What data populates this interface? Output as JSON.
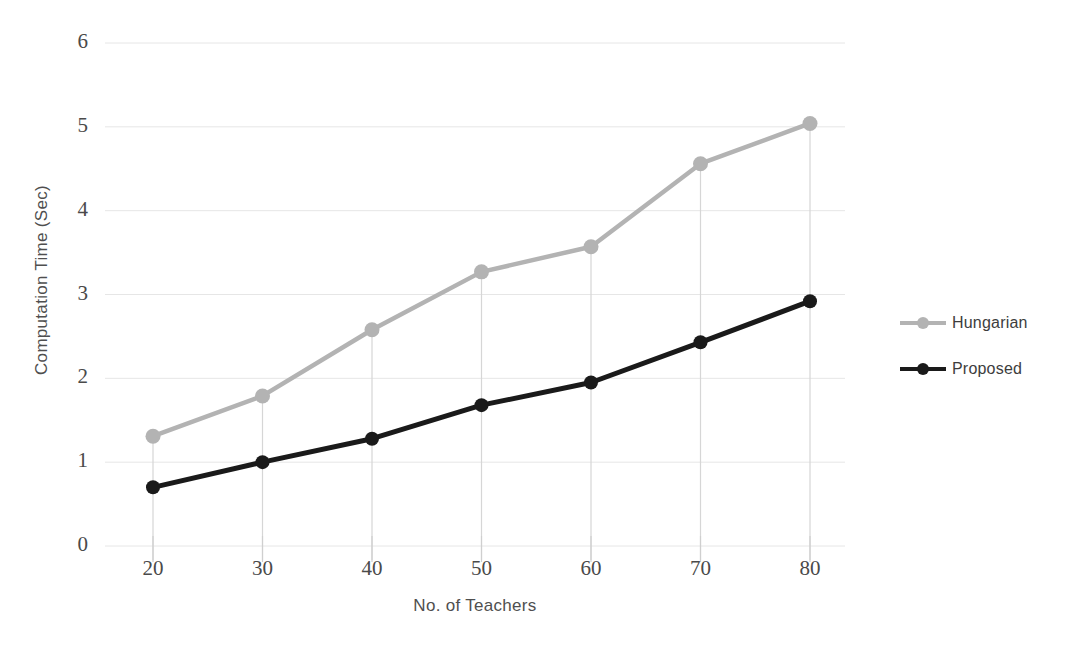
{
  "figure": {
    "cropped_header_text": "",
    "background_color": "#ffffff"
  },
  "legend": {
    "position": "right",
    "entries": [
      {
        "label": "Hungarian",
        "color": "#b3b3b3",
        "marker": "circle"
      },
      {
        "label": "Proposed",
        "color": "#1a1a1a",
        "marker": "circle"
      }
    ]
  },
  "axes": {
    "y_title": "Computation Time (Sec)",
    "x_title": "No. of Teachers",
    "y_ticks": [
      "0",
      "1",
      "2",
      "3",
      "4",
      "5",
      "6"
    ],
    "x_ticks": [
      "20",
      "30",
      "40",
      "50",
      "60",
      "70",
      "80"
    ],
    "gridline_color": "#e6e6e6",
    "droplines": true
  },
  "chart_data": {
    "type": "line",
    "title": "",
    "xlabel": "No. of Teachers",
    "ylabel": "Computation Time (Sec)",
    "x": [
      20,
      30,
      40,
      50,
      60,
      70,
      80
    ],
    "xlim": [
      20,
      80
    ],
    "ylim": [
      0,
      6
    ],
    "grid": true,
    "legend_position": "right",
    "series": [
      {
        "name": "Hungarian",
        "color": "#b3b3b3",
        "marker": "circle",
        "values": [
          1.31,
          1.79,
          2.58,
          3.27,
          3.57,
          4.56,
          5.04
        ]
      },
      {
        "name": "Proposed",
        "color": "#1a1a1a",
        "marker": "circle",
        "values": [
          0.7,
          1.0,
          1.28,
          1.68,
          1.95,
          2.43,
          2.92
        ]
      }
    ]
  }
}
